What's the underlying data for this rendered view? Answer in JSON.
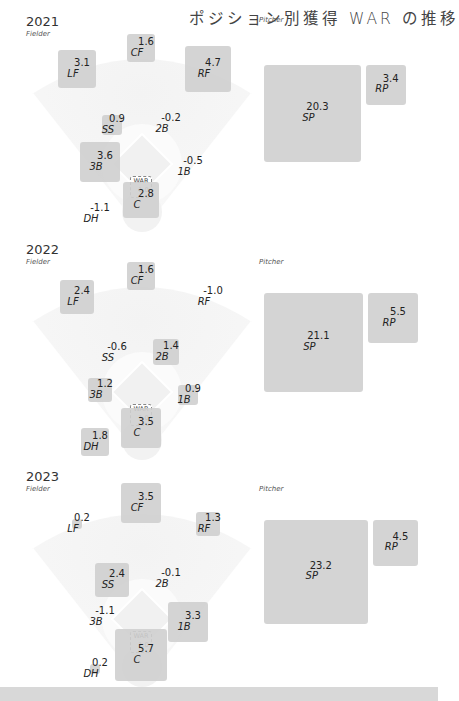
{
  "title": "ポジション別獲得 WAR の推移",
  "labels": {
    "fielder": "Fielder",
    "pitcher": "Pitcher",
    "legend_label": "WAR",
    "legend_value": "1.0"
  },
  "colors": {
    "box": "#cfcfcf",
    "field": "#f0f0f0",
    "background": "#ffffff"
  },
  "chart_data": {
    "type": "area-square (proportional squares on baseball field)",
    "title": "ポジション別獲得 WAR の推移",
    "legend": {
      "label": "WAR",
      "value": 1.0,
      "note": "square area proportional to WAR"
    },
    "years": [
      {
        "year": "2021",
        "fielder": {
          "CF": 1.6,
          "LF": 3.1,
          "RF": 4.7,
          "SS": 0.9,
          "2B": -0.2,
          "3B": 3.6,
          "1B": -0.5,
          "C": 2.8,
          "DH": -1.1
        },
        "pitcher": {
          "SP": 20.3,
          "RP": 3.4
        }
      },
      {
        "year": "2022",
        "fielder": {
          "CF": 1.6,
          "LF": 2.4,
          "RF": -1.0,
          "SS": -0.6,
          "2B": 1.4,
          "3B": 1.2,
          "1B": 0.9,
          "C": 3.5,
          "DH": 1.8
        },
        "pitcher": {
          "SP": 21.1,
          "RP": 5.5
        }
      },
      {
        "year": "2023",
        "fielder": {
          "CF": 3.5,
          "LF": 0.2,
          "RF": 1.3,
          "SS": 2.4,
          "2B": -0.1,
          "3B": -1.1,
          "1B": 3.3,
          "C": 5.7,
          "DH": 0.2
        },
        "pitcher": {
          "SP": 23.2,
          "RP": 4.5
        }
      }
    ]
  },
  "sections": [
    {
      "year": "2021",
      "positions": [
        {
          "pos": "CF",
          "val": "1.6"
        },
        {
          "pos": "LF",
          "val": "3.1"
        },
        {
          "pos": "RF",
          "val": "4.7"
        },
        {
          "pos": "SS",
          "val": "0.9"
        },
        {
          "pos": "2B",
          "val": "-0.2"
        },
        {
          "pos": "3B",
          "val": "3.6"
        },
        {
          "pos": "1B",
          "val": "-0.5"
        },
        {
          "pos": "C",
          "val": "2.8"
        },
        {
          "pos": "DH",
          "val": "-1.1"
        },
        {
          "pos": "SP",
          "val": "20.3"
        },
        {
          "pos": "RP",
          "val": "3.4"
        }
      ]
    },
    {
      "year": "2022",
      "positions": [
        {
          "pos": "CF",
          "val": "1.6"
        },
        {
          "pos": "LF",
          "val": "2.4"
        },
        {
          "pos": "RF",
          "val": "-1.0"
        },
        {
          "pos": "SS",
          "val": "-0.6"
        },
        {
          "pos": "2B",
          "val": "1.4"
        },
        {
          "pos": "3B",
          "val": "1.2"
        },
        {
          "pos": "1B",
          "val": "0.9"
        },
        {
          "pos": "C",
          "val": "3.5"
        },
        {
          "pos": "DH",
          "val": "1.8"
        },
        {
          "pos": "SP",
          "val": "21.1"
        },
        {
          "pos": "RP",
          "val": "5.5"
        }
      ]
    },
    {
      "year": "2023",
      "positions": [
        {
          "pos": "CF",
          "val": "3.5"
        },
        {
          "pos": "LF",
          "val": "0.2"
        },
        {
          "pos": "RF",
          "val": "1.3"
        },
        {
          "pos": "SS",
          "val": "2.4"
        },
        {
          "pos": "2B",
          "val": "-0.1"
        },
        {
          "pos": "3B",
          "val": "-1.1"
        },
        {
          "pos": "1B",
          "val": "3.3"
        },
        {
          "pos": "C",
          "val": "5.7"
        },
        {
          "pos": "DH",
          "val": "0.2"
        },
        {
          "pos": "SP",
          "val": "23.2"
        },
        {
          "pos": "RP",
          "val": "4.5"
        }
      ]
    }
  ]
}
